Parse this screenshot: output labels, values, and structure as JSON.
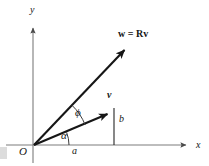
{
  "figure": {
    "background": "#ffffff",
    "stroke_color": "#161616",
    "axis_color": "#6b6b6b",
    "labels": {
      "y_axis": "y",
      "x_axis": "x",
      "origin": "O",
      "w_vector": "w = Rv",
      "v_vector": "v",
      "angle_phi": "ϕ",
      "angle_alpha": "α",
      "component_a": "a",
      "component_b": "b"
    },
    "geometry": {
      "origin": [
        34,
        145
      ],
      "x_axis_tip": [
        192,
        145
      ],
      "y_axis_tip": [
        33,
        22
      ],
      "w_tip": [
        130,
        44
      ],
      "v_tip": [
        114,
        110
      ],
      "w_angle_deg": 46.4,
      "v_angle_deg": 21.3,
      "alpha_arc_radius": 35,
      "phi_arc_radius": 55,
      "b_drop_x": 114
    }
  }
}
